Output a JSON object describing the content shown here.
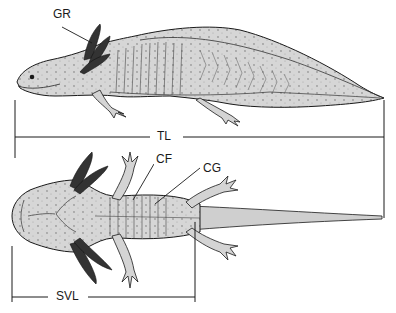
{
  "figure": {
    "labels": {
      "gills": "GR",
      "total_length": "TL",
      "caudal_fold": "CF",
      "costal_groove": "CG",
      "snout_vent_length": "SVL"
    },
    "colors": {
      "ink": "#1a1a1a",
      "body_fill": "#d4d4d4",
      "gill_fill": "#3a3a3a",
      "background": "#ffffff"
    }
  }
}
